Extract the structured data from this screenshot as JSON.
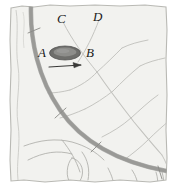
{
  "figure": {
    "name": "hand-drawn-arc-and-ellipse-diagram",
    "width": 177,
    "height": 196,
    "background_color": "#ffffff",
    "panel_fill": "#f2f2ef",
    "panel_border_color": "#b9b9b4",
    "arc_color": "#9a9a97",
    "arc_shadow_color": "#7e7e7b",
    "thin_line_color": "#c2c2be",
    "organic_line_color": "#b5b5b1",
    "ellipse_outer_color": "#6e6e6b",
    "ellipse_inner_color": "#8d8d8a",
    "arrow_color": "#3a3a38",
    "label_color": "#1a1a1a"
  },
  "labels": [
    {
      "id": "A",
      "text": "A",
      "x": 38,
      "y": 48,
      "name": "label-a"
    },
    {
      "id": "B",
      "text": "B",
      "x": 86,
      "y": 48,
      "name": "label-b"
    },
    {
      "id": "C",
      "text": "C",
      "x": 57,
      "y": 13,
      "name": "label-c"
    },
    {
      "id": "D",
      "text": "D",
      "x": 93,
      "y": 11,
      "name": "label-d"
    }
  ],
  "elements": {
    "arc_label": "thick-curved-band",
    "ellipse_label": "shaded-ellipse",
    "arrow_label": "direction-arrow-right",
    "branch_network_label": "branching-line-network",
    "organic_lines_label": "organic-curved-lines",
    "tick_marks_label": "arc-tick-marks"
  },
  "tick_marks": [
    {
      "x": 33,
      "y": 30
    },
    {
      "x": 60,
      "y": 114
    },
    {
      "x": 96,
      "y": 147
    },
    {
      "x": 160,
      "y": 172
    }
  ]
}
